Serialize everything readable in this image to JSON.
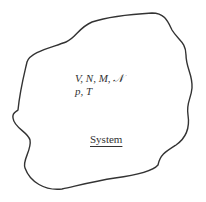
{
  "diagram": {
    "type": "thermodynamic-system",
    "variables_line1": "V, N, M, 𝒩",
    "variables_line2": "p, T",
    "label": "System",
    "boundary_color": "#333333"
  }
}
